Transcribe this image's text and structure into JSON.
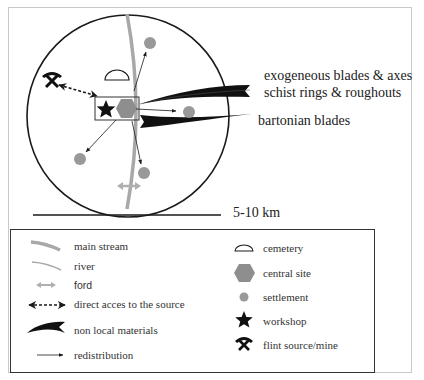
{
  "map": {
    "labels": {
      "exogeneous": "exogeneous blades & axes",
      "schist": "schist rings & roughouts",
      "bartonian": "bartonian blades"
    },
    "scale": "5-10 km"
  },
  "legend": {
    "left": [
      {
        "icon": "main-stream-icon",
        "label": "main stream"
      },
      {
        "icon": "river-icon",
        "label": "river"
      },
      {
        "icon": "ford-icon",
        "label": "ford"
      },
      {
        "icon": "direct-access-arrow-icon",
        "label": "direct acces to the source"
      },
      {
        "icon": "non-local-materials-icon",
        "label": "non local materials"
      },
      {
        "icon": "redistribution-arrow-icon",
        "label": "redistribution"
      }
    ],
    "right": [
      {
        "icon": "cemetery-icon",
        "label": "cemetery"
      },
      {
        "icon": "central-site-icon",
        "label": "central site"
      },
      {
        "icon": "settlement-icon",
        "label": "settlement"
      },
      {
        "icon": "workshop-star-icon",
        "label": "workshop"
      },
      {
        "icon": "flint-mine-icon",
        "label": "flint source/mine"
      }
    ]
  },
  "colors": {
    "stream": "#a8a8a8",
    "settlement": "#999999",
    "ink": "#1a1a1a",
    "frame": "#c8c8c8"
  }
}
